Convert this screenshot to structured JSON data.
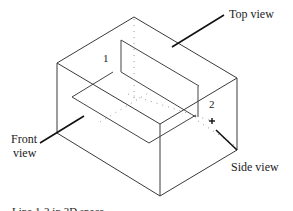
{
  "figure": {
    "caption": "Line 1-2 in 3D space",
    "labels": {
      "top_view": "Top view",
      "front_view_line1": "Front",
      "front_view_line2": "view",
      "side_view": "Side view"
    },
    "points": {
      "point1": "1",
      "point2": "2"
    },
    "colors": {
      "edge": "#3a3a3a",
      "leader": "#111111",
      "hidden": "#9a9a9a"
    }
  }
}
